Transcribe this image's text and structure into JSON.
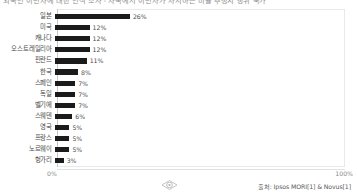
{
  "title": "외국인 이민자에 대한 인식 조사 - 자국에서 이민자가 차지하는 비율 추정치 상위 국가",
  "chart_data": {
    "type": "bar",
    "orientation": "horizontal",
    "title": "외국인 이민자에 대한 인식 조사 - 자국에서 이민자가 차지하는 비율 추정치 상위 국가",
    "xlabel": "",
    "ylabel": "",
    "xlim": [
      0,
      100
    ],
    "grid": false,
    "legend": "none",
    "categories": [
      "일본",
      "미국",
      "캐나다",
      "오스트레일리아",
      "핀란드",
      "한국",
      "스페인",
      "독일",
      "벨기에",
      "스웨덴",
      "영국",
      "프랑스",
      "노르웨이",
      "헝가리"
    ],
    "values": [
      26,
      12,
      12,
      12,
      11,
      8,
      7,
      7,
      7,
      6,
      5,
      5,
      5,
      3
    ],
    "value_labels": [
      "26%",
      "12%",
      "12%",
      "12%",
      "11%",
      "8%",
      "7%",
      "7%",
      "7%",
      "6%",
      "5%",
      "5%",
      "5%",
      "3%"
    ],
    "axis_ticks": [
      "0%",
      "100%"
    ],
    "bar_color": "#1b1b1b"
  },
  "axis": {
    "min_label": "0%",
    "max_label": "100%"
  },
  "source": {
    "text": "출처: Ipsos MORI[1] & Novus[1]"
  },
  "watermark": {
    "icon": "eye-icon"
  }
}
